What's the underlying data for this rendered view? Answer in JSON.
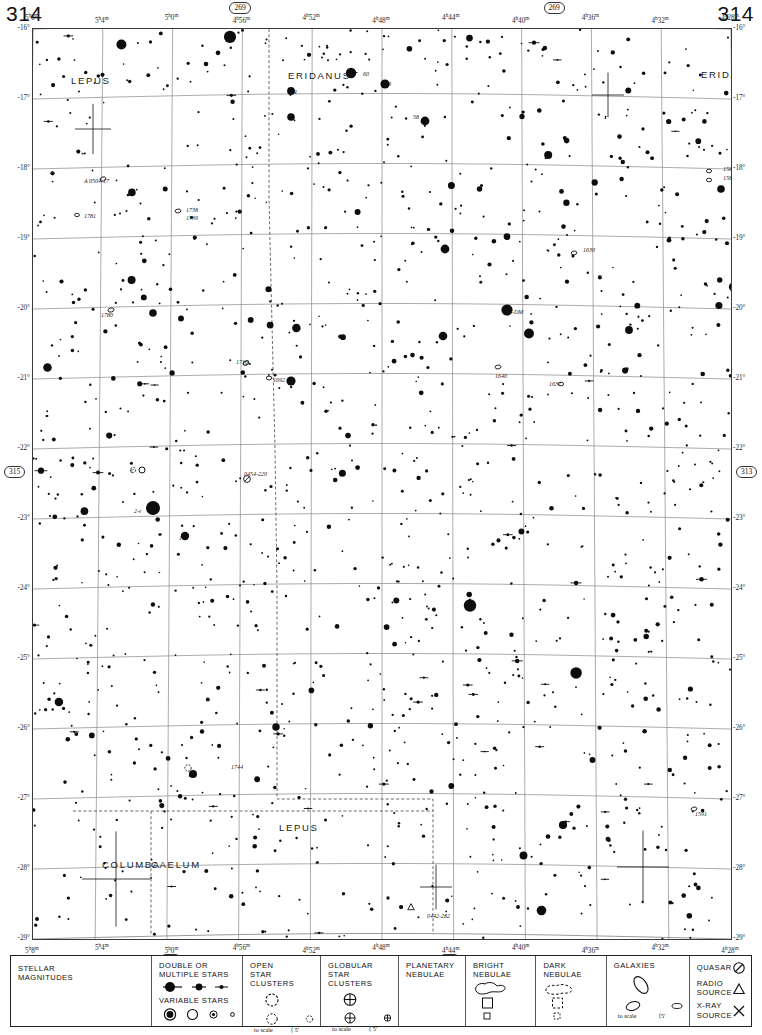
{
  "page": {
    "number_left": "314",
    "number_right": "314"
  },
  "chart": {
    "ra_ticks_top": [
      "5h8m",
      "5h4m",
      "5h0m",
      "4h56m",
      "4h52m",
      "4h48m",
      "4h44m",
      "4h40m",
      "4h36m",
      "4h32m",
      "4h28m"
    ],
    "ra_ticks_bottom": [
      "5h8m",
      "5h4m",
      "5h0m",
      "4h56m",
      "4h52m",
      "4h48m",
      "4h44m",
      "4h40m",
      "4h36m",
      "4h32m",
      "4h28m"
    ],
    "dec_ticks_left": [
      "-16°",
      "-17°",
      "-18°",
      "-19°",
      "-20°",
      "-21°",
      "-22°",
      "-23°",
      "-24°",
      "-25°",
      "-26°",
      "-27°",
      "-28°",
      "-29°"
    ],
    "dec_ticks_right": [
      "-16°",
      "-17°",
      "-18°",
      "-19°",
      "-20°",
      "-21°",
      "-22°",
      "-23°",
      "-24°",
      "-25°",
      "-26°",
      "-27°",
      "-28°",
      "-29°"
    ],
    "adjacent_charts": {
      "top_left": "269",
      "top_right": "269",
      "left": "315",
      "right": "313",
      "bottom_left": "358",
      "bottom_right": "357"
    },
    "constellations": [
      {
        "name": "LEPUS",
        "x": 38,
        "y": 46
      },
      {
        "name": "ERIDANUS",
        "x": 255,
        "y": 41
      },
      {
        "name": "ERIDANUS",
        "x": 668,
        "y": 40
      },
      {
        "name": "LEPUS",
        "x": 246,
        "y": 793
      },
      {
        "name": "COLUMBA",
        "x": 69,
        "y": 830
      },
      {
        "name": "CAELUM",
        "x": 118,
        "y": 830
      },
      {
        "name": "ERIDANUS",
        "x": 640,
        "y": 918
      }
    ],
    "object_labels": [
      {
        "text": "60",
        "x": 330,
        "y": 42
      },
      {
        "text": "59",
        "x": 352,
        "y": 52
      },
      {
        "text": "58",
        "x": 380,
        "y": 85
      },
      {
        "text": "R",
        "x": 260,
        "y": 60
      },
      {
        "text": "A 0504-17",
        "x": 51,
        "y": 149
      },
      {
        "text": "1781",
        "x": 51,
        "y": 184
      },
      {
        "text": "1738",
        "x": 153,
        "y": 178
      },
      {
        "text": "1739",
        "x": 153,
        "y": 186
      },
      {
        "text": "1780",
        "x": 68,
        "y": 283
      },
      {
        "text": "1716",
        "x": 203,
        "y": 330
      },
      {
        "text": "1692",
        "x": 240,
        "y": 348
      },
      {
        "text": "1630",
        "x": 550,
        "y": 218
      },
      {
        "text": "54-DM",
        "x": 473,
        "y": 280
      },
      {
        "text": "1640",
        "x": 462,
        "y": 344
      },
      {
        "text": "1637",
        "x": 516,
        "y": 352
      },
      {
        "text": "1584",
        "x": 690,
        "y": 137
      },
      {
        "text": "1583",
        "x": 690,
        "y": 146
      },
      {
        "text": "T",
        "x": 97,
        "y": 439
      },
      {
        "text": "2-ε",
        "x": 101,
        "y": 479
      },
      {
        "text": "1",
        "x": 146,
        "y": 506
      },
      {
        "text": "0454-220",
        "x": 211,
        "y": 442
      },
      {
        "text": "1744",
        "x": 198,
        "y": 735
      },
      {
        "text": "1591",
        "x": 662,
        "y": 782
      },
      {
        "text": "0442-282",
        "x": 394,
        "y": 884
      },
      {
        "text": "0503-290",
        "x": 81,
        "y": 925
      }
    ]
  },
  "legend": {
    "stellar_magnitudes": {
      "title_line1": "STELLAR",
      "title_line2": "MAGNITUDES",
      "row_top": [
        "-1",
        "0",
        "1",
        "2"
      ],
      "row_bottom": [
        "3",
        "4",
        "5",
        "6",
        "7",
        "8",
        "9",
        ">9.5"
      ]
    },
    "double_stars": {
      "title_line1": "DOUBLE OR",
      "title_line2": "MULTIPLE STARS",
      "variable_title": "VARIABLE STARS"
    },
    "open_clusters": {
      "title_line1": "OPEN",
      "title_line2": "STAR CLUSTERS",
      "scale_label": "to scale",
      "small_label": "⟨ 5'"
    },
    "globular_clusters": {
      "title_line1": "GLOBULAR",
      "title_line2": "STAR CLUSTERS",
      "scale_label": "to scale",
      "small_label": "⟨ 5'"
    },
    "planetary_nebulae": {
      "title_line1": "PLANETARY",
      "title_line2": "NEBULAE",
      "sizes": [
        "⟩120\"",
        "120\"-60\"",
        "60\"-30\"",
        "⟨30\""
      ]
    },
    "bright_nebulae": {
      "title_line1": "BRIGHT",
      "title_line2": "NEBULAE",
      "items": [
        "to scale",
        "10'-5'",
        "⟨5'"
      ]
    },
    "dark_nebulae": {
      "title_line1": "DARK",
      "title_line2": "NEBULAE",
      "items": [
        "to scale",
        "10'-5'",
        "⟨5'"
      ]
    },
    "galaxies": {
      "title": "GALAXIES",
      "scale_label": "to scale",
      "small_label": "⟨5'"
    },
    "other_objects": {
      "quasar": "QUASAR",
      "radio_line1": "RADIO",
      "radio_line2": "SOURCE",
      "xray_line1": "X-RAY",
      "xray_line2": "SOURCE"
    }
  },
  "colors": {
    "ink": "#111111",
    "grid": "#8a8a8a",
    "border": "#333333",
    "paper": "#ffffff"
  }
}
